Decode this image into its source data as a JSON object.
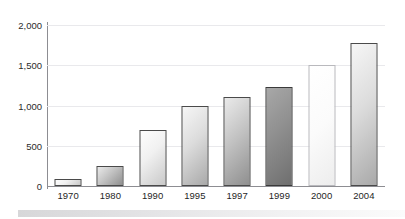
{
  "chart_data": {
    "type": "bar",
    "title": "",
    "xlabel": "",
    "ylabel": "",
    "categories": [
      "1970",
      "1980",
      "1990",
      "1995",
      "1997",
      "1999",
      "2000",
      "2004"
    ],
    "values": [
      90,
      250,
      700,
      1000,
      1100,
      1225,
      1500,
      1775
    ],
    "ytick_labels": [
      "2,000",
      "1,500",
      "1,000",
      "500",
      "0"
    ],
    "ytick_values": [
      2000,
      1500,
      1000,
      500,
      0
    ],
    "ylim": [
      0,
      2000
    ],
    "grid": true,
    "legend": false,
    "series": [
      {
        "name": "",
        "values": [
          90,
          250,
          700,
          1000,
          1100,
          1225,
          1500,
          1775
        ]
      }
    ],
    "bar_tones": [
      "tone-a",
      "tone-c",
      "tone-a",
      "tone-b",
      "tone-c",
      "tone-dark",
      "tone-light",
      "tone-b"
    ],
    "colors": {
      "axis": "#8d8d92",
      "gridline": "#e9e9ec",
      "bar_outline": "#4a4a4a",
      "bar_light": "#fdfdfd",
      "bar_dark": "#6f6f6f",
      "text": "#1f1f1f",
      "bottom_band": "#d7d7d9"
    }
  },
  "title_fragment": ""
}
